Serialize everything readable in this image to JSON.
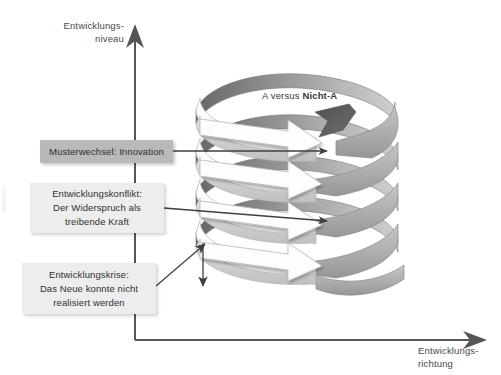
{
  "diagram": {
    "title_hidden": "Entwicklungsspirale",
    "background": "#ffffff",
    "axes": {
      "y_label": "Entwicklungs-\nniveau",
      "x_label": "Entwicklungs-\nrichtung",
      "axis_color": "#555555"
    },
    "spiral": {
      "caption_prefix": "A versus ",
      "caption_emphasis": "Nicht-A",
      "front_ribbon_color": "#f7f7f7",
      "back_ribbon_color": "#8f8f8f",
      "right_ribbon_color": "#b0b0b0",
      "dark_arrow_color": "#5d5d5d",
      "turns": 5
    },
    "callouts": [
      {
        "id": "innovation",
        "text": "Musterwechsel: Innovation",
        "style": "dark",
        "fill": "#b9b9b9"
      },
      {
        "id": "konflikt",
        "text": "Entwicklungskonflikt:\nDer Widerspruch als\ntreibende Kraft",
        "style": "light",
        "fill": "#ededed"
      },
      {
        "id": "krise",
        "text": "Entwicklungskrise:\nDas Neue konnte nicht\nrealisiert werden",
        "style": "light",
        "fill": "#ededed"
      }
    ]
  }
}
